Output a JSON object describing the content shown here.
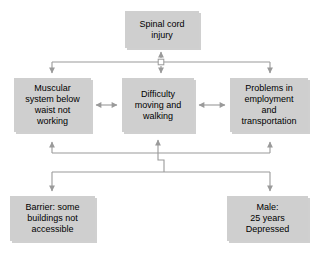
{
  "diagram": {
    "type": "flowchart",
    "title_visible": false,
    "style": {
      "box_fill": "#cfcfcf",
      "box_shadow": "#969696",
      "connector_color": "#9a9a9a",
      "text_color": "#000000",
      "background": "#ffffff"
    },
    "nodes": [
      {
        "id": "spinal-cord-injury",
        "label": "Spinal cord\ninjury",
        "role": "health-condition"
      },
      {
        "id": "muscular-system",
        "label": "Muscular\nsystem below\nwaist not\nworking",
        "role": "body-function-structure"
      },
      {
        "id": "difficulty-moving",
        "label": "Difficulty\nmoving and\nwalking",
        "role": "activity"
      },
      {
        "id": "problems-employment",
        "label": "Problems in\nemployment\nand\ntransportation",
        "role": "participation"
      },
      {
        "id": "barrier-buildings",
        "label": "Barrier: some\nbuildings not\naccessible",
        "role": "environmental-factor"
      },
      {
        "id": "male-depressed",
        "label": "Male:\n25 years\nDepressed",
        "role": "personal-factor"
      }
    ],
    "connectors": [
      {
        "from": "spinal-cord-injury",
        "to": "muscular-system",
        "arrow": "bidirectional-bus"
      },
      {
        "from": "spinal-cord-injury",
        "to": "difficulty-moving",
        "arrow": "bidirectional"
      },
      {
        "from": "spinal-cord-injury",
        "to": "problems-employment",
        "arrow": "bidirectional-bus"
      },
      {
        "from": "muscular-system",
        "to": "difficulty-moving",
        "arrow": "bidirectional"
      },
      {
        "from": "difficulty-moving",
        "to": "problems-employment",
        "arrow": "bidirectional"
      },
      {
        "from": "barrier-buildings",
        "to": "muscular-system",
        "arrow": "bidirectional-bus"
      },
      {
        "from": "barrier-buildings",
        "to": "difficulty-moving",
        "arrow": "bidirectional-bus"
      },
      {
        "from": "male-depressed",
        "to": "problems-employment",
        "arrow": "bidirectional-bus"
      }
    ]
  }
}
